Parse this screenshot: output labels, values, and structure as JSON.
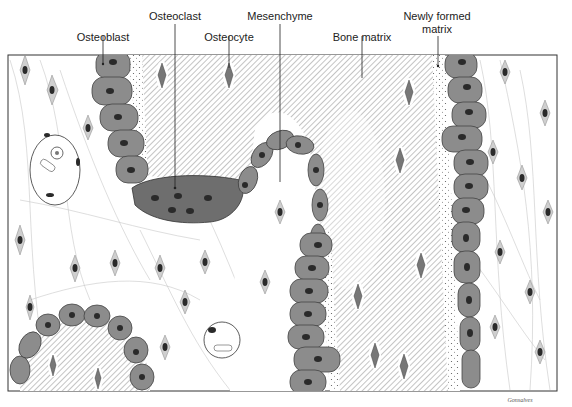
{
  "diagram": {
    "labels": {
      "osteoblast": "Osteoblast",
      "osteoclast": "Osteoclast",
      "osteocyte": "Osteocyte",
      "mesenchyme": "Mesenchyme",
      "bone_matrix": "Bone matrix",
      "newly_formed_matrix_line1": "Newly formed",
      "newly_formed_matrix_line2": "matrix"
    },
    "signature": "Gonsalves",
    "colors": {
      "cell_fill": "#8c8c8c",
      "osteoclast_fill": "#6e6e6e",
      "nucleus": "#2a2a2a",
      "hatch": "#9a9a9a",
      "outline": "#333333"
    }
  }
}
